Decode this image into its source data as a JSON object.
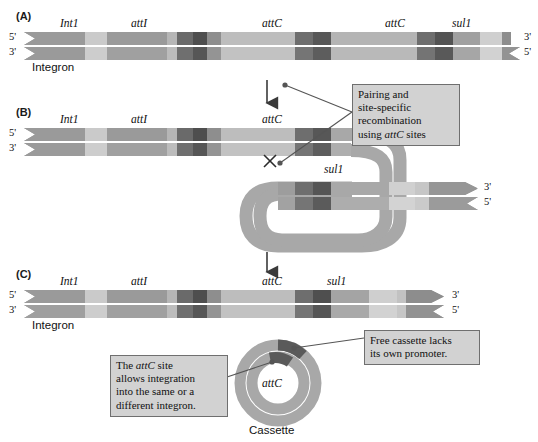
{
  "figure": {
    "background": "#ffffff"
  },
  "colors": {
    "dna_light": "#c9c9c9",
    "dna_mid": "#9a9a9a",
    "dna_dark": "#6e6e6e",
    "dna_darkest": "#4a4a4a",
    "callout_fill": "#d2d2d2",
    "callout_border": "#6f6f6f",
    "line": "#555555",
    "text": "#111111"
  },
  "panels": [
    {
      "id": "A",
      "label": "(A)",
      "caption": "Integron",
      "strand_top_end_left": "5'",
      "strand_top_end_right": "3'",
      "strand_bottom_end_left": "3'",
      "strand_bottom_end_right": "5'",
      "gene_labels": [
        "Int1",
        "attI",
        "attC",
        "attC",
        "sul1"
      ]
    },
    {
      "id": "B",
      "label": "(B)",
      "caption": "",
      "strand_top_end_left": "5'",
      "strand_top_end_right": "3'",
      "strand_bottom_end_left": "3'",
      "strand_bottom_end_right": "5'",
      "gene_labels": [
        "Int1",
        "attI",
        "attC",
        "sul1"
      ],
      "crossover_mark": "X"
    },
    {
      "id": "C",
      "label": "(C)",
      "caption": "Integron",
      "strand_top_end_left": "5'",
      "strand_top_end_right": "3'",
      "strand_bottom_end_left": "3'",
      "strand_bottom_end_right": "5'",
      "gene_labels": [
        "Int1",
        "attI",
        "attC",
        "sul1"
      ]
    }
  ],
  "cassette": {
    "inner_label": "attC",
    "caption": "Cassette"
  },
  "callouts": [
    {
      "id": "pairing",
      "lines": [
        "Pairing and",
        "site-specific",
        "recombination",
        "using attC sites"
      ],
      "italic_term": "attC"
    },
    {
      "id": "integration",
      "lines": [
        "The attC site",
        "allows integration",
        "into the same or a",
        "different integron."
      ],
      "italic_term": "attC"
    },
    {
      "id": "promoter",
      "lines": [
        "Free cassette lacks",
        "its own promoter."
      ],
      "italic_term": ""
    }
  ],
  "arrows": {
    "a_to_b": "down-arrow",
    "b_to_c": "down-arrow"
  }
}
